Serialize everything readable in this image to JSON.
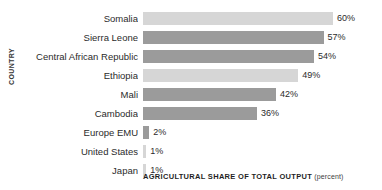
{
  "chart_data": {
    "type": "bar",
    "orientation": "horizontal",
    "title": "",
    "xlabel": "AGRICULTURAL SHARE OF TOTAL OUTPUT",
    "xlabel_unit": "(percent)",
    "ylabel": "COUNTRY",
    "grid": false,
    "legend": null,
    "xlim": [
      0,
      60
    ],
    "value_suffix": "%",
    "categories": [
      "Somalia",
      "Sierra Leone",
      "Central African Republic",
      "Ethiopia",
      "Mali",
      "Cambodia",
      "Europe EMU",
      "United States",
      "Japan"
    ],
    "values": [
      60,
      57,
      54,
      49,
      42,
      36,
      2,
      1,
      1
    ],
    "value_labels": [
      "60%",
      "57%",
      "54%",
      "49%",
      "42%",
      "36%",
      "2%",
      "1%",
      "1%"
    ],
    "bar_shades": [
      "light",
      "dark",
      "dark",
      "light",
      "dark",
      "dark",
      "dark",
      "light",
      "light"
    ],
    "colors": {
      "bar_light": "#d6d6d6",
      "bar_dark": "#9b9b9b",
      "text": "#2b2b2b",
      "background": "#ffffff"
    }
  }
}
